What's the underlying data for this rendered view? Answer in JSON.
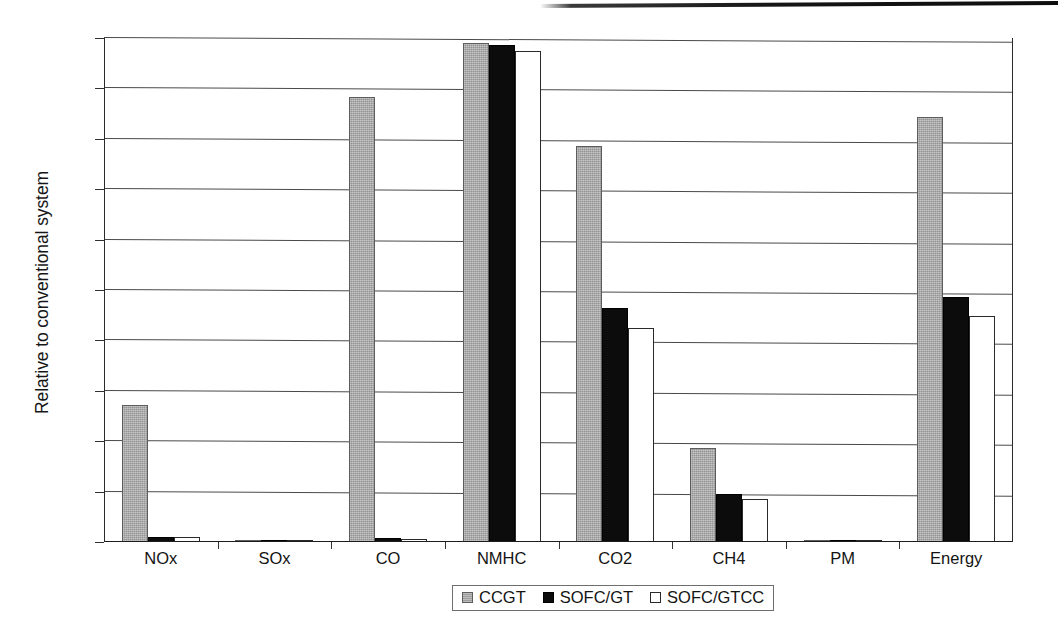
{
  "chart_data": {
    "type": "bar",
    "title": "",
    "xlabel": "",
    "ylabel": "Relative to conventional system",
    "ylim": [
      0,
      100
    ],
    "ytick_labels": [
      "0%",
      "10%",
      "20%",
      "30%",
      "40%",
      "50%",
      "60%",
      "70%",
      "80%",
      "90%",
      "100%"
    ],
    "ytick_values": [
      0,
      10,
      20,
      30,
      40,
      50,
      60,
      70,
      80,
      90,
      100
    ],
    "grid": true,
    "legend_position": "bottom-center",
    "categories": [
      "NOx",
      "SOx",
      "CO",
      "NMHC",
      "CO2",
      "CH4",
      "PM",
      "Energy"
    ],
    "series": [
      {
        "name": "CCGT",
        "color": "#a9a9a9",
        "values": [
          27.2,
          0.2,
          88.2,
          99.1,
          78.5,
          18.7,
          0.3,
          84.3
        ]
      },
      {
        "name": "SOFC/GT",
        "color": "#0c0c0c",
        "values": [
          1.0,
          0.2,
          0.8,
          98.7,
          46.5,
          9.6,
          0.4,
          48.6
        ]
      },
      {
        "name": "SOFC/GTCC",
        "color": "#ffffff",
        "values": [
          0.9,
          0.2,
          0.5,
          97.5,
          42.5,
          8.5,
          0.3,
          44.8
        ]
      }
    ]
  },
  "axis": {
    "y_title": "Relative to conventional system"
  },
  "legend": {
    "items": [
      {
        "label": "CCGT",
        "swatch": "ccgt"
      },
      {
        "label": "SOFC/GT",
        "swatch": "sofcgt"
      },
      {
        "label": "SOFC/GTCC",
        "swatch": "sofcgtcc"
      }
    ]
  }
}
